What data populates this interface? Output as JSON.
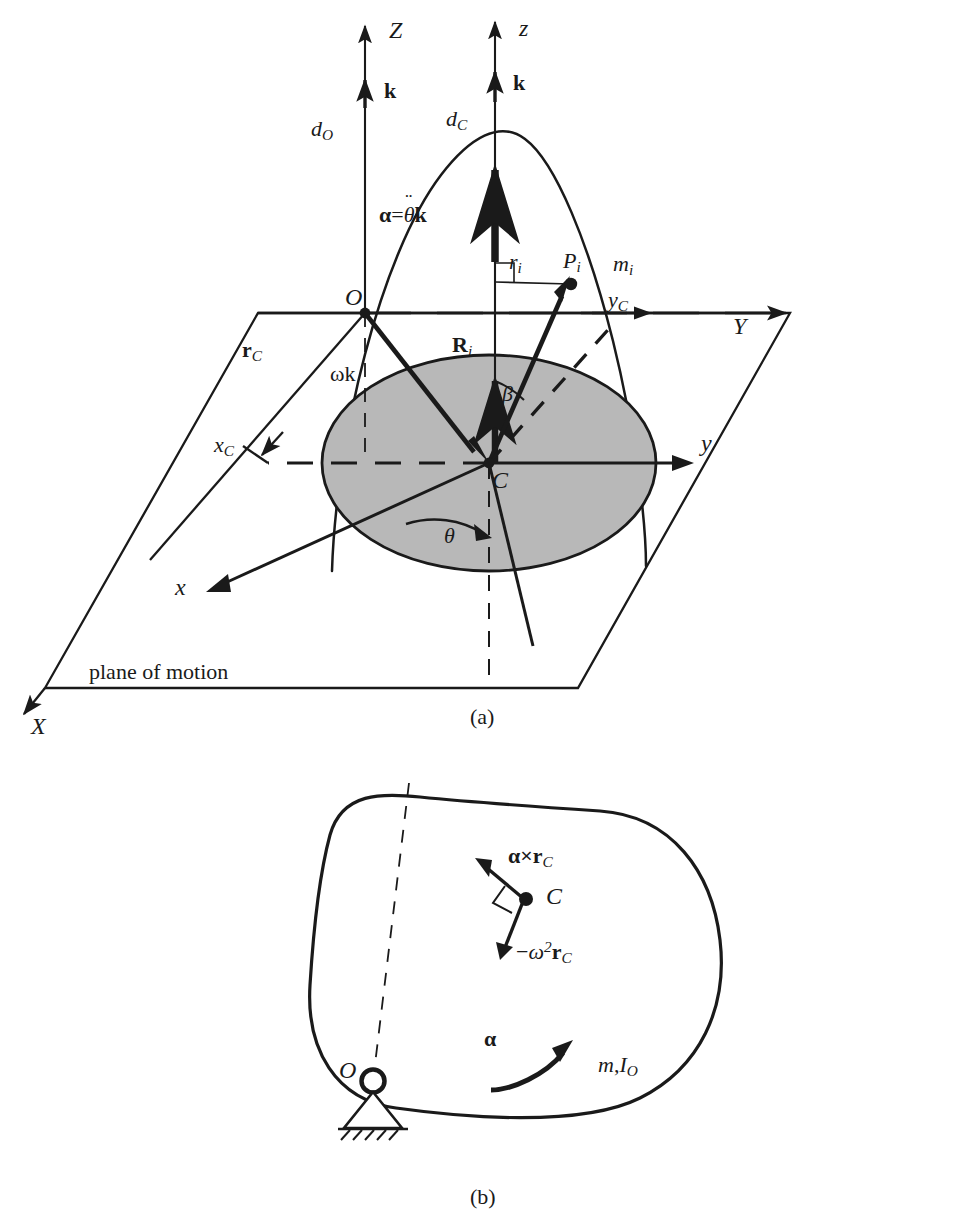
{
  "figure": {
    "caption_a": "(a)",
    "caption_b": "(b)",
    "plane_label": "plane of motion"
  },
  "panel_a": {
    "axes": {
      "Z": "Z",
      "z": "z",
      "X": "X",
      "Y": "Y",
      "x": "x",
      "y": "y",
      "xC_base": "x",
      "xC_sub": "C",
      "yC_base": "y",
      "yC_sub": "C"
    },
    "unit_vectors": {
      "k_global": "k",
      "k_body": "k"
    },
    "heights": {
      "dO_base": "d",
      "dO_sub": "O",
      "dC_base": "d",
      "dC_sub": "C"
    },
    "points": {
      "O": "O",
      "C": "C",
      "Pi_base": "P",
      "Pi_sub": "i"
    },
    "quantities": {
      "mi_base": "m",
      "mi_sub": "i",
      "ri_base": "r",
      "ri_sub": "i",
      "rC_base": "r",
      "rC_sub": "C",
      "Ri_base": "R",
      "Ri_sub": "i",
      "omega_k": "ωk",
      "alpha_eq_lead": "α",
      "alpha_eq_mid": "=",
      "alpha_eq_theta": "θ",
      "alpha_eq_k": "k",
      "beta": "β",
      "theta": "θ"
    }
  },
  "panel_b": {
    "points": {
      "O": "O",
      "C": "C"
    },
    "vectors": {
      "alpha_cross_lead": "α",
      "alpha_cross_times": "×",
      "alpha_cross_r": "r",
      "alpha_cross_sub": "C",
      "centripetal_minus": "−",
      "centripetal_omega": "ω",
      "centripetal_pow": "2",
      "centripetal_r": "r",
      "centripetal_sub": "C",
      "alpha": "α"
    },
    "properties": {
      "mass_base": "m",
      "comma": ",",
      "inertia_base": "I",
      "inertia_sub": "O"
    }
  },
  "colors": {
    "ink": "#1a1a1a",
    "shaded_disk": "#b8b8b8",
    "disk_edge": "#1a1a1a",
    "background": "#ffffff"
  }
}
